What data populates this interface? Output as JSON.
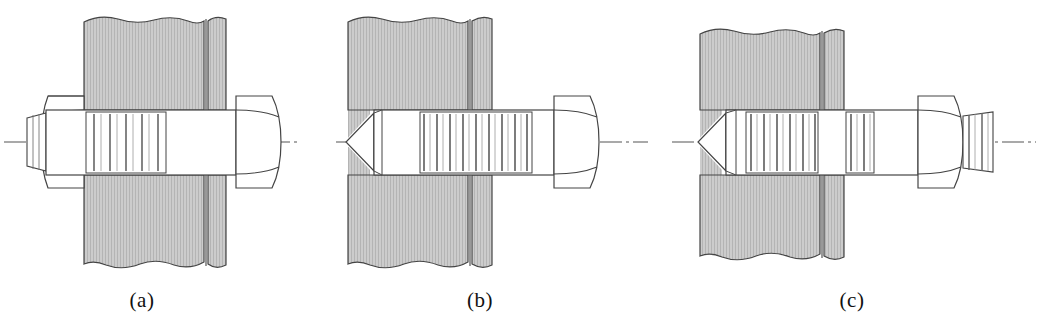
{
  "figure": {
    "background_color": "#ffffff",
    "line_color": "#3a3a3a",
    "hatch_fill_color": "#c9c9c9",
    "hatch_line_color": "#a8a8a8",
    "metal_fill_color": "#ffffff",
    "centerline_color": "#4a4a4a",
    "width": 1040,
    "height": 327
  },
  "captions": {
    "a": "(a)",
    "b": "(b)",
    "c": "(c)"
  },
  "panels": [
    {
      "id": "a",
      "label": "(a)",
      "description": "Through bolt with hex head and hex nut clamping two plates",
      "fastener_type": "hex-head-bolt-with-nut",
      "has_conical_point": false,
      "head_side": "right",
      "nut_side": "left",
      "thread_run_count": 6,
      "plate_count": 2,
      "centerline_y": 142
    },
    {
      "id": "b",
      "label": "(b)",
      "description": "Hex head cap screw threaded into tapped hole in solid material",
      "fastener_type": "hex-head-cap-screw",
      "has_conical_point": true,
      "head_side": "right",
      "nut_side": "none",
      "thread_run_count": 11,
      "plate_count": 2,
      "centerline_y": 142
    },
    {
      "id": "c",
      "label": "(c)",
      "description": "Stud threaded into solid material with hex nut and protruding threaded end",
      "fastener_type": "stud-with-nut",
      "has_conical_point": true,
      "head_side": "none",
      "nut_side": "right",
      "thread_run_count": 7,
      "plate_count": 2,
      "centerline_y": 142
    }
  ]
}
